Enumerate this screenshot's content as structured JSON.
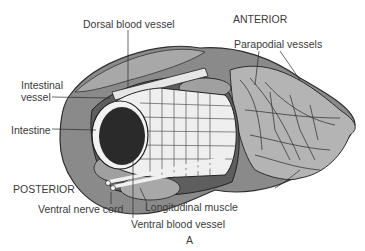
{
  "figure": {
    "panel_label": "A",
    "orientation": {
      "anterior": "ANTERIOR",
      "posterior": "POSTERIOR"
    },
    "labels": {
      "dorsal_blood_vessel": "Dorsal blood vessel",
      "parapodial_vessels": "Parapodial vessels",
      "intestinal_vessel_line1": "Intestinal",
      "intestinal_vessel_line2": "vessel",
      "intestine": "Intestine",
      "ventral_nerve_cord": "Ventral nerve cord",
      "longitudinal_muscle": "Longitudinal muscle",
      "ventral_blood_vessel": "Ventral blood vessel"
    },
    "colors": {
      "body_dark": "#6b6b6b",
      "body_mid": "#9a9a9a",
      "body_light": "#c8c8c8",
      "intestine_grid": "#efefef",
      "lumen": "#2a2a2a",
      "text": "#3a3a3a"
    }
  }
}
